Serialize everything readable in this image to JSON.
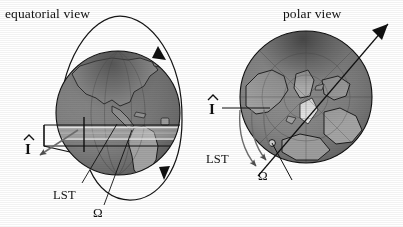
{
  "figure": {
    "kind": "astrodynamics-diagram",
    "background_color": "#ffffff",
    "ink_color": "#101010",
    "panels": [
      {
        "id": "equatorial",
        "title": "equatorial view",
        "globe": {
          "name": "earth-globe-equatorial",
          "center_x": 118,
          "center_y": 113,
          "radius": 62,
          "land_shown": "North America, Central America, South America",
          "fill_light": "#b9b9b9",
          "fill_dark": "#3a3a3a",
          "ocean_tone": "#7d7d7d",
          "land_tone": "#9a9a9a"
        },
        "labels": {
          "i_hat": "I",
          "i_hat_accent": "^",
          "lst": "LST",
          "omega": "Ω"
        },
        "features": [
          "orbit-ellipse",
          "orbit-direction-arrow",
          "equatorial-plane-band",
          "ascending-node-meridian",
          "local-sidereal-time-arc"
        ]
      },
      {
        "id": "polar",
        "title": "polar view",
        "globe": {
          "name": "earth-globe-polar",
          "center_x": 306,
          "center_y": 97,
          "radius": 66,
          "land_shown": "Arctic, Greenland, northern Europe, northern Asia, Canada",
          "fill_light": "#bdbdbd",
          "fill_dark": "#3c3c3c",
          "ocean_tone": "#7a7a7a",
          "land_tone": "#9c9c9c"
        },
        "labels": {
          "i_hat": "I",
          "i_hat_accent": "^",
          "lst": "LST",
          "omega": "Ω"
        },
        "features": [
          "orbit-line-through-pole",
          "orbit-direction-arrow",
          "vernal-equinox-reference-line",
          "lst-angle-arc",
          "raan-angle-arc",
          "ascending-node-marker"
        ]
      }
    ]
  }
}
